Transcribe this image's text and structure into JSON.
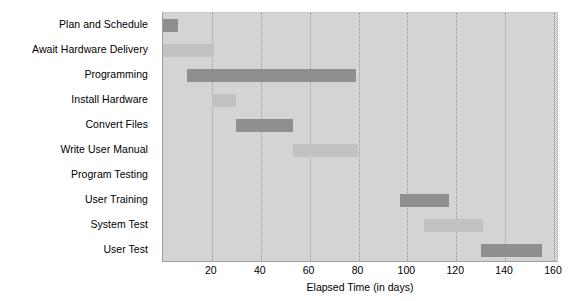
{
  "chart_data": {
    "type": "bar",
    "subtype": "gantt",
    "title": "",
    "xlabel": "Elapsed Time (in days)",
    "ylabel": "",
    "xlim": [
      0,
      160
    ],
    "xticks": [
      20,
      40,
      60,
      80,
      100,
      120,
      140,
      160
    ],
    "grid": "vertical-dotted",
    "legend": "none",
    "categories": [
      "Plan and Schedule",
      "Await Hardware Delivery",
      "Programming",
      "Install Hardware",
      "Convert Files",
      "Write User Manual",
      "Program Testing",
      "User Training",
      "System Test",
      "User Test"
    ],
    "tasks": [
      {
        "label": "Plan and Schedule",
        "start": 0,
        "end": 6,
        "duration": 6,
        "shade": "dark"
      },
      {
        "label": "Await Hardware Delivery",
        "start": 0,
        "end": 21,
        "duration": 21,
        "shade": "light"
      },
      {
        "label": "Programming",
        "start": 10,
        "end": 79,
        "duration": 69,
        "shade": "dark"
      },
      {
        "label": "Install Hardware",
        "start": 20,
        "end": 30,
        "duration": 10,
        "shade": "light"
      },
      {
        "label": "Convert Files",
        "start": 30,
        "end": 53,
        "duration": 23,
        "shade": "dark"
      },
      {
        "label": "Write User Manual",
        "start": 53,
        "end": 80,
        "duration": 27,
        "shade": "light"
      },
      {
        "label": "Program Testing",
        "start": 80,
        "end": 80,
        "duration": 0,
        "shade": "light"
      },
      {
        "label": "User Training",
        "start": 97,
        "end": 117,
        "duration": 20,
        "shade": "dark"
      },
      {
        "label": "System Test",
        "start": 107,
        "end": 131,
        "duration": 24,
        "shade": "light"
      },
      {
        "label": "User Test",
        "start": 130,
        "end": 155,
        "duration": 25,
        "shade": "dark"
      }
    ],
    "colors": {
      "plot_background": "#d4d4d4",
      "bar_dark": "#8f8f8f",
      "bar_light": "#c2c2c2",
      "gridline": "#9a9a9a",
      "text": "#000000"
    }
  }
}
